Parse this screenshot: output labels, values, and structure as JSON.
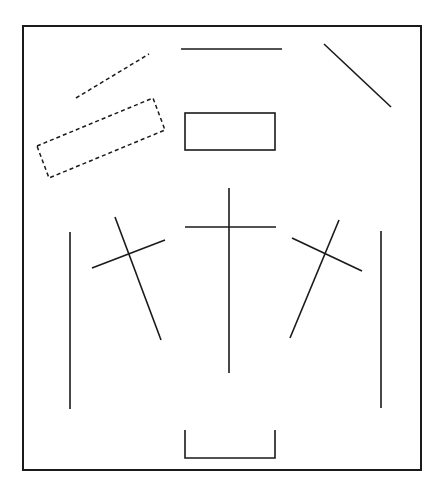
{
  "diagram": {
    "width": 442,
    "height": 495,
    "stroke_color": "#1a1a1a",
    "background": "#ffffff",
    "frame": {
      "x": 23,
      "y": 26,
      "width": 398,
      "height": 444
    },
    "shapes": [
      {
        "name": "dashed-line-top-left",
        "type": "line",
        "style": "dashed",
        "x1": 76,
        "y1": 98,
        "x2": 149,
        "y2": 54
      },
      {
        "name": "dashed-rotated-rectangle",
        "type": "polygon",
        "style": "dashed",
        "points": "37,146 153,98 165,130 49,178"
      },
      {
        "name": "top-horizontal-line",
        "type": "line",
        "style": "solid",
        "x1": 181,
        "y1": 49,
        "x2": 282,
        "y2": 49
      },
      {
        "name": "top-right-diagonal-line",
        "type": "line",
        "style": "solid",
        "x1": 324,
        "y1": 44,
        "x2": 391,
        "y2": 107
      },
      {
        "name": "center-rectangle",
        "type": "rect",
        "style": "solid",
        "x": 185,
        "y": 113,
        "width": 90,
        "height": 37
      },
      {
        "name": "left-vertical-line",
        "type": "line",
        "style": "solid",
        "x1": 70,
        "y1": 232,
        "x2": 70,
        "y2": 409
      },
      {
        "name": "left-cross-long",
        "type": "line",
        "style": "solid",
        "x1": 115,
        "y1": 217,
        "x2": 161,
        "y2": 340
      },
      {
        "name": "left-cross-short",
        "type": "line",
        "style": "solid",
        "x1": 92,
        "y1": 268,
        "x2": 165,
        "y2": 240
      },
      {
        "name": "center-cross-vertical",
        "type": "line",
        "style": "solid",
        "x1": 229,
        "y1": 188,
        "x2": 229,
        "y2": 373
      },
      {
        "name": "center-cross-horizontal",
        "type": "line",
        "style": "solid",
        "x1": 185,
        "y1": 227,
        "x2": 276,
        "y2": 227
      },
      {
        "name": "right-cross-long",
        "type": "line",
        "style": "solid",
        "x1": 339,
        "y1": 220,
        "x2": 290,
        "y2": 338
      },
      {
        "name": "right-cross-short",
        "type": "line",
        "style": "solid",
        "x1": 292,
        "y1": 238,
        "x2": 362,
        "y2": 271
      },
      {
        "name": "right-vertical-line",
        "type": "line",
        "style": "solid",
        "x1": 381,
        "y1": 231,
        "x2": 381,
        "y2": 408
      },
      {
        "name": "bottom-bracket",
        "type": "polyline",
        "style": "solid",
        "points": "185,430 185,458 275,458 275,430"
      }
    ]
  }
}
